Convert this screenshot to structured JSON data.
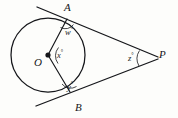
{
  "figure": {
    "kind": "geometry-diagram",
    "canvas": {
      "width": 178,
      "height": 118
    },
    "background_color": "#fdfdfb",
    "stroke_color": "#15161a"
  },
  "circle": {
    "center_label": "O",
    "center_x": 48,
    "center_y": 55,
    "radius": 37,
    "center_dot_radius": 2.6
  },
  "points": [
    {
      "id": "A",
      "label": "A",
      "x": 67,
      "y": 19,
      "label_x": 67,
      "label_y": 3
    },
    {
      "id": "B",
      "label": "B",
      "x": 70,
      "y": 92,
      "label_x": 76,
      "label_y": 103
    },
    {
      "id": "O",
      "label": "O",
      "x": 48,
      "y": 55,
      "label_x": 35,
      "label_y": 57
    },
    {
      "id": "P",
      "label": "P",
      "x": 152,
      "y": 58,
      "label_x": 159,
      "label_y": 50
    }
  ],
  "angles": [
    {
      "id": "w",
      "label": "w",
      "degree_symbol": "°",
      "vertex": "A",
      "label_x": 65,
      "label_y": 27
    },
    {
      "id": "x",
      "label": "x",
      "degree_symbol": "°",
      "vertex": "O",
      "label_x": 57,
      "label_y": 50
    },
    {
      "id": "y",
      "label": "y",
      "degree_symbol": "°",
      "vertex": "B",
      "label_x": 67,
      "label_y": 82
    },
    {
      "id": "z",
      "label": "z",
      "degree_symbol": "°",
      "vertex": "P",
      "label_x": 128,
      "label_y": 53
    }
  ],
  "segments": [
    {
      "id": "radius-OA",
      "from": "O",
      "to": "A",
      "x1": 48,
      "y1": 55,
      "x2": 67,
      "y2": 19
    },
    {
      "id": "radius-OB",
      "from": "O",
      "to": "B",
      "x1": 48,
      "y1": 55,
      "x2": 70,
      "y2": 92
    },
    {
      "id": "tangent-AP",
      "from": "A",
      "to": "P",
      "x1": 37,
      "y1": 7,
      "x2": 158,
      "y2": 57
    },
    {
      "id": "tangent-BP",
      "from": "B",
      "to": "P",
      "x1": 36,
      "y1": 106,
      "x2": 158,
      "y2": 59
    }
  ],
  "arcs": [
    {
      "id": "arc-w",
      "at": "A",
      "d": "M 60.5 27.5 A 10 10 0 0 0 73.5 24.5"
    },
    {
      "id": "arc-x",
      "at": "O",
      "d": "M 58.5 47.5 A 13 13 0 0 0 58.0 63.5"
    },
    {
      "id": "arc-y",
      "at": "B",
      "d": "M 62.0 84.0 A 11 11 0 0 0 76.5 86.5"
    },
    {
      "id": "arc-z",
      "at": "P",
      "d": "M 139.5 50.5 A 15 15 0 0 0 139.0 66.0"
    }
  ]
}
